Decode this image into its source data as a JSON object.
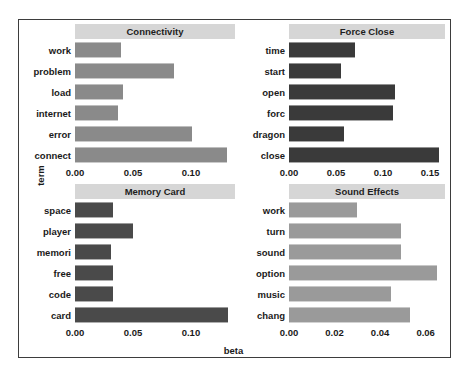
{
  "chart_data": {
    "type": "bar",
    "title": "",
    "xlabel": "beta",
    "ylabel": "term",
    "orientation": "horizontal",
    "grid": false,
    "legend": "none",
    "facet_layout": "2x2",
    "panels": [
      {
        "name": "Connectivity",
        "bar_color": "#8a8a8a",
        "categories": [
          "work",
          "problem",
          "load",
          "internet",
          "error",
          "connect"
        ],
        "values": [
          0.04,
          0.085,
          0.041,
          0.037,
          0.101,
          0.131
        ],
        "xlim": [
          0,
          0.138
        ],
        "xticks": [
          0.0,
          0.05,
          0.1
        ],
        "xtick_labels": [
          "0.00",
          "0.05",
          "0.10"
        ]
      },
      {
        "name": "Force Close",
        "bar_color": "#3a3a3a",
        "categories": [
          "time",
          "start",
          "open",
          "forc",
          "dragon",
          "close"
        ],
        "values": [
          0.07,
          0.055,
          0.113,
          0.111,
          0.058,
          0.16
        ],
        "xlim": [
          0,
          0.166
        ],
        "xticks": [
          0.0,
          0.05,
          0.1,
          0.15
        ],
        "xtick_labels": [
          "0.00",
          "0.05",
          "0.10",
          "0.15"
        ]
      },
      {
        "name": "Memory Card",
        "bar_color": "#4a4a4a",
        "categories": [
          "space",
          "player",
          "memori",
          "free",
          "code",
          "card"
        ],
        "values": [
          0.033,
          0.05,
          0.031,
          0.033,
          0.033,
          0.132
        ],
        "xlim": [
          0,
          0.138
        ],
        "xticks": [
          0.0,
          0.05,
          0.1
        ],
        "xtick_labels": [
          "0.00",
          "0.05",
          "0.10"
        ]
      },
      {
        "name": "Sound Effects",
        "bar_color": "#9a9a9a",
        "categories": [
          "work",
          "turn",
          "sound",
          "option",
          "music",
          "chang"
        ],
        "values": [
          0.03,
          0.049,
          0.049,
          0.065,
          0.045,
          0.053
        ],
        "xlim": [
          0,
          0.0685
        ],
        "xticks": [
          0.0,
          0.02,
          0.04,
          0.06
        ],
        "xtick_labels": [
          "0.00",
          "0.02",
          "0.04",
          "0.06"
        ]
      }
    ]
  },
  "figure": {
    "background": "#ffffff",
    "frame_color": "#3d3d3d",
    "strip_background": "#d6d6d6",
    "text_color": "#1a1a1a"
  }
}
